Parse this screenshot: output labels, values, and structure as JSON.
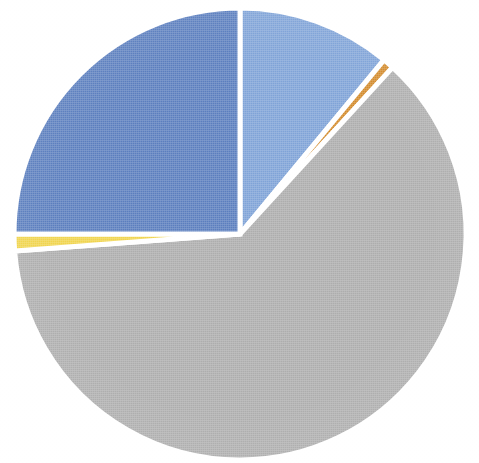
{
  "chart_data": {
    "type": "pie",
    "title": "",
    "subtitle": "",
    "xlabel": "",
    "ylabel": "",
    "grid": false,
    "legend_position": "none",
    "has_labels": false,
    "start_angle_deg": 0,
    "direction": "clockwise",
    "center": {
      "x": 240,
      "y": 234
    },
    "radius": 226,
    "slice_gap_color": "#ffffff",
    "slice_gap_width": 5,
    "categories": [
      "Light blue segment",
      "Orange segment",
      "Gray segment",
      "Yellow segment",
      "Dark blue segment"
    ],
    "values": [
      11.0,
      0.8,
      62.0,
      1.2,
      25.0
    ],
    "units": "percent",
    "total": 100.0,
    "slices": [
      {
        "name": "Light blue segment",
        "value": 11.0,
        "percent": "11.0%",
        "color": "#7FA3D7",
        "start_deg": 0.0,
        "end_deg": 39.6
      },
      {
        "name": "Orange segment",
        "value": 0.8,
        "percent": "0.8%",
        "color": "#D38B2C",
        "start_deg": 39.6,
        "end_deg": 42.5
      },
      {
        "name": "Gray segment",
        "value": 62.0,
        "percent": "62.0%",
        "color": "#ADADAD",
        "start_deg": 42.5,
        "end_deg": 265.7
      },
      {
        "name": "Yellow segment",
        "value": 1.2,
        "percent": "1.2%",
        "color": "#F0D44D",
        "start_deg": 265.7,
        "end_deg": 270.0
      },
      {
        "name": "Dark blue segment",
        "value": 25.0,
        "percent": "25.0%",
        "color": "#5B7EBE",
        "start_deg": 270.0,
        "end_deg": 360.0
      }
    ],
    "colors": [
      "#7FA3D7",
      "#D38B2C",
      "#ADADAD",
      "#F0D44D",
      "#5B7EBE"
    ],
    "background_color": "#FFFFFF"
  }
}
